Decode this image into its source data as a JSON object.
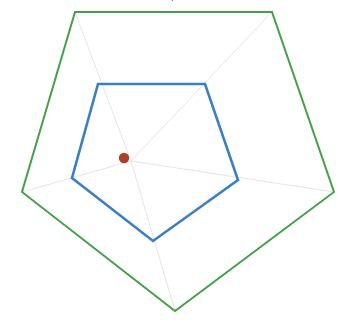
{
  "page": {
    "background_color": "#ffffff",
    "width": 345,
    "height": 321
  },
  "clipped_title_text": "|",
  "chart_data": {
    "type": "line",
    "subtype": "radar",
    "title": "",
    "subtitle": "",
    "xlabel": "",
    "ylabel": "",
    "categories": [
      "Axis 1",
      "Axis 2",
      "Axis 3",
      "Axis 4",
      "Axis 5"
    ],
    "tick_labels": [],
    "grid": true,
    "grid_style": "spokes-only",
    "legend": false,
    "legend_position": "none",
    "axis_count": 5,
    "rmin": 0,
    "rmax": 100,
    "center": {
      "x": 131,
      "y": 161
    },
    "dot_center": {
      "x": 124,
      "y": 158
    },
    "series": [
      {
        "name": "Outer",
        "color": "#45a049",
        "stroke_width": 2,
        "fill": "none",
        "values": [
          100,
          100,
          100,
          100,
          100
        ],
        "points": [
          {
            "x": 75,
            "y": 12
          },
          {
            "x": 272,
            "y": 12
          },
          {
            "x": 334,
            "y": 192
          },
          {
            "x": 175,
            "y": 311
          },
          {
            "x": 22,
            "y": 192
          }
        ]
      },
      {
        "name": "Inner",
        "color": "#3a7ec8",
        "stroke_width": 2.6,
        "fill": "none",
        "values": [
          52,
          52,
          48,
          47,
          48
        ],
        "points": [
          {
            "x": 98,
            "y": 84
          },
          {
            "x": 205,
            "y": 84
          },
          {
            "x": 238,
            "y": 180
          },
          {
            "x": 153,
            "y": 241
          },
          {
            "x": 72,
            "y": 178
          }
        ]
      }
    ],
    "spokes": [
      {
        "x": 75,
        "y": 12
      },
      {
        "x": 272,
        "y": 12
      },
      {
        "x": 334,
        "y": 192
      },
      {
        "x": 175,
        "y": 311
      },
      {
        "x": 22,
        "y": 192
      }
    ],
    "spoke_color": "#e6e6e6",
    "spoke_width": 1,
    "center_marker": {
      "label": "center-point",
      "color": "#a8432a",
      "radius": 5.2
    }
  }
}
